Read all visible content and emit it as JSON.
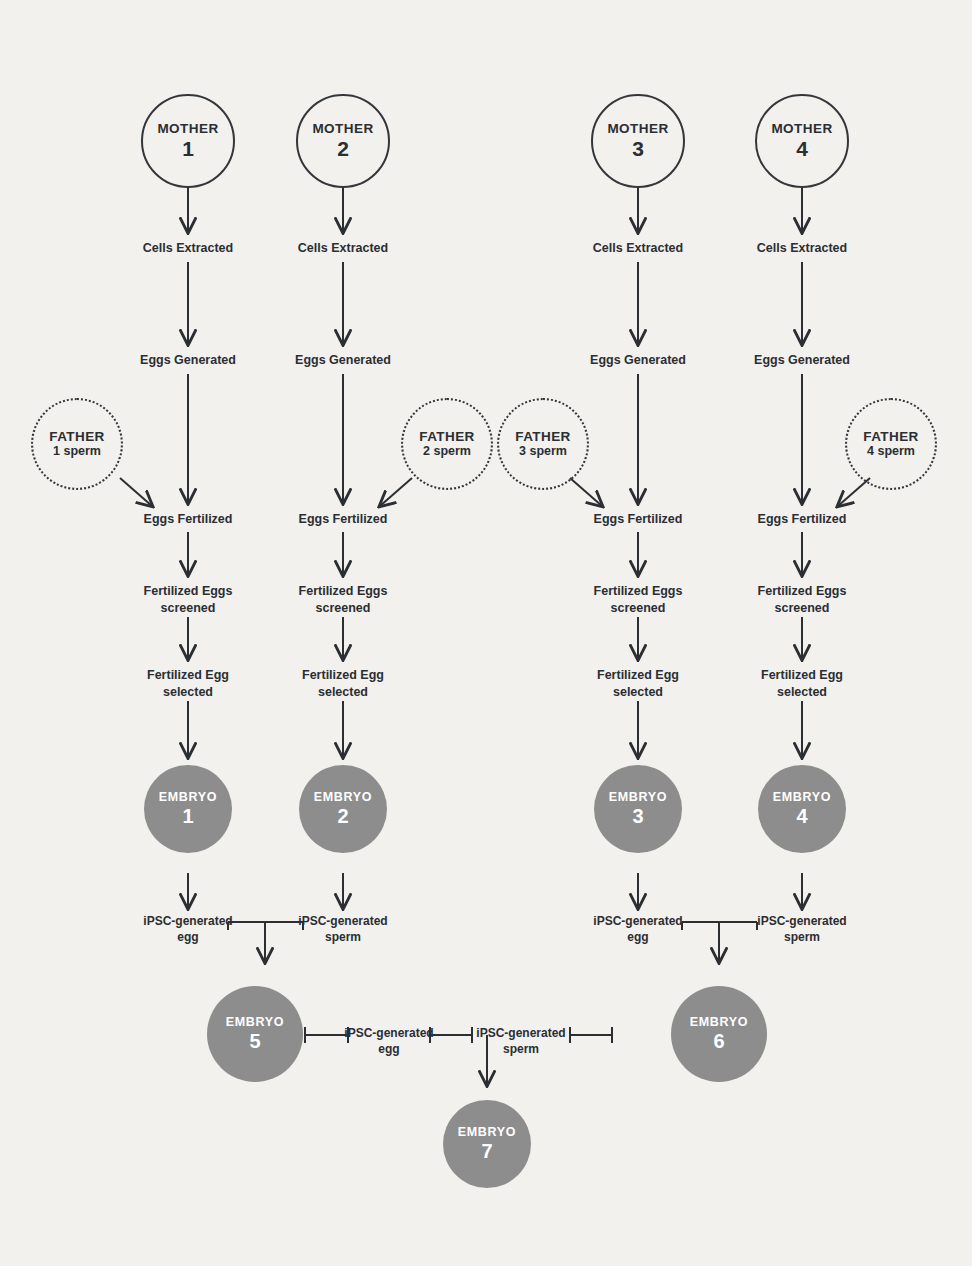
{
  "theme": {
    "background": "#f2f1ed",
    "ink": "#2b2e33",
    "stroke": "#33363b",
    "embryo_fill": "#8d8d8d",
    "embryo_text": "#ffffff"
  },
  "diagram": {
    "mothers": [
      {
        "label": "MOTHER",
        "number": "1"
      },
      {
        "label": "MOTHER",
        "number": "2"
      },
      {
        "label": "MOTHER",
        "number": "3"
      },
      {
        "label": "MOTHER",
        "number": "4"
      }
    ],
    "fathers": [
      {
        "label": "FATHER",
        "sub": "1 sperm"
      },
      {
        "label": "FATHER",
        "sub": "2 sperm"
      },
      {
        "label": "FATHER",
        "sub": "3 sperm"
      },
      {
        "label": "FATHER",
        "sub": "4 sperm"
      }
    ],
    "steps": {
      "cells_extracted": "Cells Extracted",
      "eggs_generated": "Eggs Generated",
      "eggs_fertilized": "Eggs Fertilized",
      "eggs_screened": "Fertilized Eggs\nscreened",
      "egg_selected": "Fertilized Egg\nselected"
    },
    "column_steps": [
      {
        "cells_extracted": "Cells Extracted",
        "eggs_generated": "Eggs Generated",
        "eggs_fertilized": "Eggs Fertilized",
        "eggs_screened": "Fertilized Eggs\nscreened",
        "egg_selected": "Fertilized Egg\nselected"
      },
      {
        "cells_extracted": "Cells Extracted",
        "eggs_generated": "Eggs Generated",
        "eggs_fertilized": "Eggs Fertilized",
        "eggs_screened": "Fertilized Eggs\nscreened",
        "egg_selected": "Fertilized Egg\nselected"
      },
      {
        "cells_extracted": "Cells Extracted",
        "eggs_generated": "Eggs Generated",
        "eggs_fertilized": "Eggs Fertilized",
        "eggs_screened": "Fertilized Eggs\nscreened",
        "egg_selected": "Fertilized Egg\nselected"
      },
      {
        "cells_extracted": "Cells Extracted",
        "eggs_generated": "Eggs Generated",
        "eggs_fertilized": "Eggs Fertilized",
        "eggs_screened": "Fertilized Eggs\nscreened",
        "egg_selected": "Fertilized Egg\nselected"
      }
    ],
    "embryos": [
      {
        "label": "EMBRYO",
        "number": "1"
      },
      {
        "label": "EMBRYO",
        "number": "2"
      },
      {
        "label": "EMBRYO",
        "number": "3"
      },
      {
        "label": "EMBRYO",
        "number": "4"
      },
      {
        "label": "EMBRYO",
        "number": "5"
      },
      {
        "label": "EMBRYO",
        "number": "6"
      },
      {
        "label": "EMBRYO",
        "number": "7"
      }
    ],
    "gamete_labels": {
      "egg_left": "iPSC-generated\negg",
      "sperm_left": "iPSC-generated\nsperm",
      "egg_right": "iPSC-generated\negg",
      "sperm_right": "iPSC-generated\nsperm",
      "egg_bottom": "iPSC-generated\negg",
      "sperm_bottom": "iPSC-generated\nsperm"
    }
  }
}
